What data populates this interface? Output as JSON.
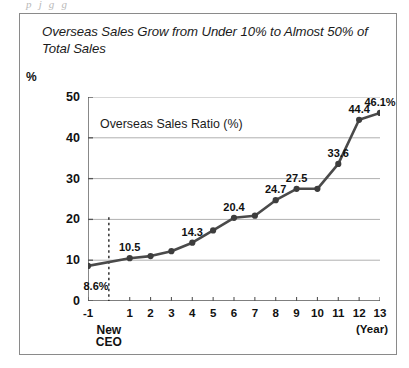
{
  "page_top_text": "p   j        g                              g",
  "chart_title": "Overseas Sales Grow from Under 10% to Almost 50% of Total Sales",
  "series_label": "Overseas Sales Ratio (%)",
  "y_axis_unit": "%",
  "x_axis_unit": "(Year)",
  "annotation": {
    "line1": "New",
    "line2": "CEO"
  },
  "chart_data": {
    "type": "line",
    "title": "Overseas Sales Grow from Under 10% to Almost 50% of Total Sales",
    "xlabel": "(Year)",
    "ylabel": "%",
    "ylim": [
      0,
      50
    ],
    "xlim": [
      -1,
      13
    ],
    "grid": "horizontal",
    "legend_position": "inside-top-left",
    "series": [
      {
        "name": "Overseas Sales Ratio (%)",
        "color": "#4a4a4a",
        "x": [
          -1,
          1,
          2,
          3,
          4,
          5,
          6,
          7,
          8,
          9,
          10,
          11,
          12,
          13
        ],
        "values": [
          8.6,
          10.5,
          11.0,
          12.2,
          14.3,
          17.3,
          20.4,
          20.9,
          24.7,
          27.5,
          27.5,
          33.6,
          44.4,
          46.1
        ],
        "point_labels": [
          "8.6%",
          "10.5",
          "",
          "",
          "14.3",
          "",
          "20.4",
          "",
          "24.7",
          "27.5",
          "",
          "33.6",
          "44.4",
          "46.1%"
        ]
      }
    ],
    "y_ticks": [
      0,
      10,
      20,
      30,
      40,
      50
    ],
    "y_tick_labels": [
      "0",
      "10",
      "20",
      "30",
      "40",
      "50"
    ],
    "x_ticks": [
      -1,
      1,
      2,
      3,
      4,
      5,
      6,
      7,
      8,
      9,
      10,
      11,
      12,
      13
    ],
    "x_tick_labels": [
      "-1",
      "1",
      "2",
      "3",
      "4",
      "5",
      "6",
      "7",
      "8",
      "9",
      "10",
      "11",
      "12",
      "13"
    ],
    "annotations": [
      {
        "type": "vertical-dashed-line",
        "x": 0,
        "label": "New CEO"
      }
    ]
  },
  "colors": {
    "line": "#4a4a4a",
    "marker": "#3d3d3d",
    "gridline": "#b0b0b0",
    "axis": "#555555",
    "frame": "#8a8a8a",
    "text": "#111111"
  }
}
